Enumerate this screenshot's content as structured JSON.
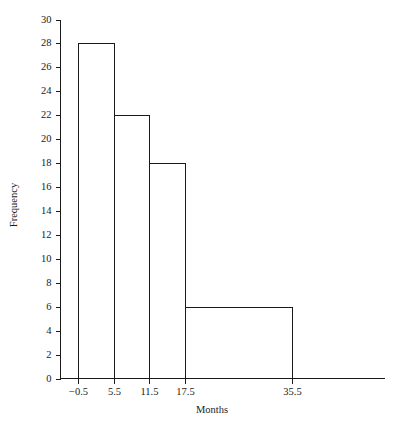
{
  "chart_data": {
    "type": "bar",
    "title": "",
    "subtitle": "",
    "xlabel": "Months",
    "ylabel": "Frequency",
    "grid": false,
    "legend": "none",
    "bin_edges": [
      -0.5,
      5.5,
      11.5,
      17.5,
      35.5
    ],
    "categories": [
      "-0.5 to 5.5",
      "5.5 to 11.5",
      "11.5 to 17.5",
      "17.5 to 35.5"
    ],
    "values": [
      28,
      22,
      18,
      6
    ],
    "bars": [
      {
        "left": -0.5,
        "right": 5.5,
        "value": 28
      },
      {
        "left": 5.5,
        "right": 11.5,
        "value": 22
      },
      {
        "left": 11.5,
        "right": 17.5,
        "value": 18
      },
      {
        "left": 17.5,
        "right": 35.5,
        "value": 6
      }
    ],
    "xlim": [
      -0.5,
      45.0
    ],
    "ylim": [
      0,
      30
    ],
    "x_tick_labels": [
      "−0.5",
      "5.5",
      "11.5",
      "17.5",
      "35.5"
    ],
    "x_tick_values": [
      -0.5,
      5.5,
      11.5,
      17.5,
      35.5
    ],
    "y_tick_labels": [
      "0",
      "2",
      "4",
      "6",
      "8",
      "10",
      "12",
      "14",
      "16",
      "18",
      "20",
      "22",
      "24",
      "26",
      "28",
      "30"
    ],
    "y_tick_values": [
      0,
      2,
      4,
      6,
      8,
      10,
      12,
      14,
      16,
      18,
      20,
      22,
      24,
      26,
      28,
      30
    ],
    "colors": {
      "background": "#ffffff",
      "axis": "#1a1a1a",
      "bar_stroke": "#1a1a1a",
      "bar_fill": "none",
      "text": "#1a1a1a"
    }
  }
}
